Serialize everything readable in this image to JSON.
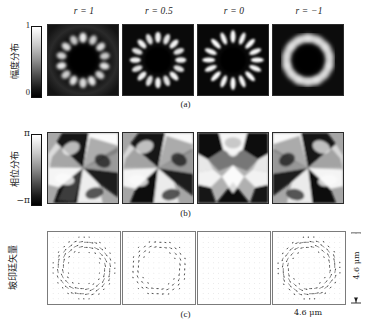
{
  "figure": {
    "columns": [
      {
        "param": "r",
        "value": "1",
        "label": "r = 1"
      },
      {
        "param": "r",
        "value": "0.5",
        "label": "r = 0.5"
      },
      {
        "param": "r",
        "value": "0",
        "label": "r = 0"
      },
      {
        "param": "r",
        "value": "-1",
        "label": "r = −1"
      }
    ],
    "rows": [
      {
        "caption": "(a)",
        "ylabel": "幅度分布",
        "cb_top": "1",
        "cb_bottom": "0"
      },
      {
        "caption": "(b)",
        "ylabel": "相位分布",
        "cb_top": "π",
        "cb_bottom": "−π"
      },
      {
        "caption": "(c)",
        "ylabel": "坡印廷矢量",
        "cb_top": "",
        "cb_bottom": ""
      }
    ],
    "scale_horizontal": "4.6 μm",
    "scale_vertical": "4.6 μm",
    "colors": {
      "ink": "#1a1a1a",
      "panel_border": "#2b2b2b",
      "quiver_border": "#7b7b7b",
      "grid_dot": "#c8c8c8"
    }
  },
  "chart_data": {
    "type": "heatmap",
    "title": "",
    "xlabel": "4.6 μm",
    "ylabel": "4.6 μm",
    "grid": false,
    "legend": "colorbar-left",
    "columns": [
      "r = 1",
      "r = 0.5",
      "r = 0",
      "r = −1"
    ],
    "rows": [
      "幅度分布 (a)",
      "相位分布 (b)",
      "坡印廷矢量 (c)"
    ],
    "field_extent_um": 4.6,
    "panels": [
      {
        "row": "amplitude",
        "caption": "(a)",
        "cmap": "gray",
        "zlim": [
          0,
          1
        ],
        "ticks": [
          "0",
          "1"
        ],
        "series": [
          {
            "name": "r = 1",
            "lobes": 14,
            "ring_radius_frac": 0.4,
            "lobe_contrast": 0.45,
            "core": "dark",
            "spiral_twist": 0.3
          },
          {
            "name": "r = 0.5",
            "lobes": 16,
            "ring_radius_frac": 0.4,
            "lobe_contrast": 0.7,
            "core": "dark",
            "spiral_twist": 0.18
          },
          {
            "name": "r = 0",
            "lobes": 16,
            "ring_radius_frac": 0.41,
            "lobe_contrast": 0.95,
            "core": "dark",
            "spiral_twist": 0.0
          },
          {
            "name": "r = −1",
            "lobes": 14,
            "ring_radius_frac": 0.4,
            "lobe_contrast": 0.35,
            "core": "dark",
            "spiral_twist": -0.3
          }
        ]
      },
      {
        "row": "phase",
        "caption": "(b)",
        "cmap": "gray",
        "zlim": [
          -3.14159,
          3.14159
        ],
        "ticks": [
          "−π",
          "π"
        ],
        "series": [
          {
            "name": "r = 1",
            "topological_charge": 7,
            "symmetry": "spiral",
            "handedness": "ccw"
          },
          {
            "name": "r = 0.5",
            "topological_charge": 7,
            "symmetry": "spiral",
            "handedness": "ccw"
          },
          {
            "name": "r = 0",
            "topological_charge": 0,
            "symmetry": "mirror",
            "handedness": "none"
          },
          {
            "name": "r = −1",
            "topological_charge": 7,
            "symmetry": "spiral",
            "handedness": "cw"
          }
        ]
      },
      {
        "row": "poynting",
        "caption": "(c)",
        "cmap": "none",
        "series": [
          {
            "name": "r = 1",
            "vector_field": "azimuthal",
            "ring_radius_frac": 0.33,
            "magnitude": 1.0,
            "direction": "ccw"
          },
          {
            "name": "r = 0.5",
            "vector_field": "azimuthal",
            "ring_radius_frac": 0.32,
            "magnitude": 0.62,
            "direction": "ccw"
          },
          {
            "name": "r = 0",
            "vector_field": "none",
            "ring_radius_frac": 0.0,
            "magnitude": 0.0,
            "direction": "none"
          },
          {
            "name": "r = −1",
            "vector_field": "azimuthal",
            "ring_radius_frac": 0.34,
            "magnitude": 1.0,
            "direction": "cw"
          }
        ]
      }
    ]
  }
}
